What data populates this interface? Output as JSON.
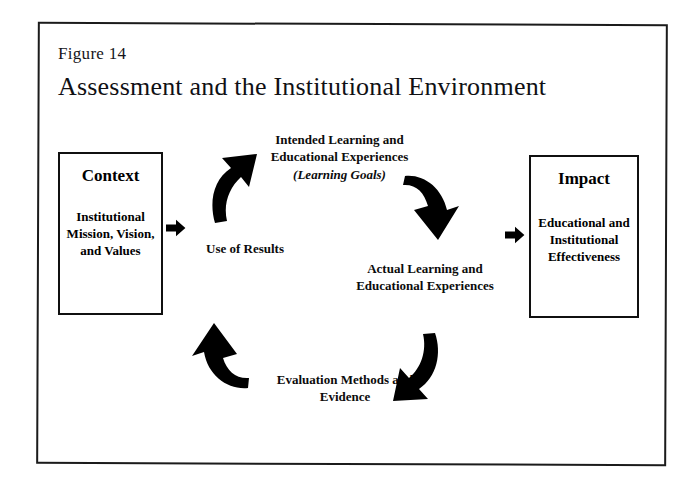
{
  "figure": {
    "number_label": "Figure 14",
    "title": "Assessment and the Institutional Environment"
  },
  "boxes": {
    "context": {
      "heading": "Context",
      "body": "Institutional Mission, Vision, and Values"
    },
    "impact": {
      "heading": "Impact",
      "body": "Educational and Institutional Effectiveness"
    }
  },
  "cycle": {
    "intended": {
      "main": "Intended Learning and Educational Experiences",
      "parenthetical": "(Learning Goals)"
    },
    "actual": "Actual Learning and Educational Experiences",
    "evaluation": "Evaluation Methods and Evidence",
    "use_of_results": "Use of Results"
  },
  "arrows": {
    "context_to_cycle": "right-arrow-icon",
    "cycle_to_impact": "right-arrow-icon",
    "use_to_intended": "curved-arrow-up-right-icon",
    "intended_to_actual": "curved-arrow-down-right-icon",
    "actual_to_evaluation": "curved-arrow-down-left-icon",
    "evaluation_to_use": "curved-arrow-up-left-icon"
  },
  "colors": {
    "ink": "#000000",
    "frame": "#1b1b1b",
    "paper": "#ffffff"
  }
}
